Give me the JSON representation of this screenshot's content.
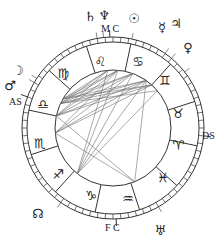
{
  "chart": {
    "center": [
      113,
      128
    ],
    "outer_radius": 91,
    "degree_ring_inner_radius": 86,
    "sign_ring_inner_radius": 58,
    "line_color": "#333333",
    "aspect_line_color": "#6e6e6e"
  },
  "angles": {
    "mc": "M C",
    "fc": "F C",
    "as": "AS",
    "ds": "DS"
  },
  "signs": [
    {
      "name": "leo",
      "glyph": "♌",
      "x": 100,
      "y": 61
    },
    {
      "name": "cancer",
      "glyph": "♋",
      "x": 138,
      "y": 61
    },
    {
      "name": "gemini",
      "glyph": "♊",
      "x": 165,
      "y": 80
    },
    {
      "name": "taurus",
      "glyph": "♉",
      "x": 178,
      "y": 113
    },
    {
      "name": "aries",
      "glyph": "♈",
      "x": 178,
      "y": 145
    },
    {
      "name": "pisces",
      "glyph": "♓",
      "x": 163,
      "y": 177
    },
    {
      "name": "aquarius",
      "glyph": "♒",
      "x": 128,
      "y": 198
    },
    {
      "name": "capricorn",
      "glyph": "♑",
      "x": 91,
      "y": 195
    },
    {
      "name": "sagittarius",
      "glyph": "♐",
      "x": 58,
      "y": 174
    },
    {
      "name": "scorpio",
      "glyph": "♏",
      "x": 40,
      "y": 143
    },
    {
      "name": "libra",
      "glyph": "♎",
      "x": 43,
      "y": 104
    },
    {
      "name": "virgo",
      "glyph": "♍",
      "x": 63,
      "y": 73
    }
  ],
  "planets": [
    {
      "name": "saturn",
      "glyph": "♄",
      "x": 90,
      "y": 16
    },
    {
      "name": "neptune",
      "glyph": "♆",
      "x": 104,
      "y": 15
    },
    {
      "name": "sun",
      "glyph": "☉",
      "x": 134,
      "y": 18
    },
    {
      "name": "mercury",
      "glyph": "☿",
      "x": 162,
      "y": 27
    },
    {
      "name": "jupiter",
      "glyph": "♃",
      "x": 176,
      "y": 23
    },
    {
      "name": "venus",
      "glyph": "♀",
      "x": 188,
      "y": 47
    },
    {
      "name": "moon",
      "glyph": "☽",
      "x": 18,
      "y": 70
    },
    {
      "name": "mars",
      "glyph": "♂",
      "x": 10,
      "y": 85
    },
    {
      "name": "node",
      "glyph": "☊",
      "x": 38,
      "y": 213
    },
    {
      "name": "uranus",
      "glyph": "♅",
      "x": 160,
      "y": 230
    }
  ],
  "angle_labels": [
    {
      "key": "mc",
      "text": "M C",
      "x": 101,
      "y": 24
    },
    {
      "key": "fc",
      "text": "F C",
      "x": 105,
      "y": 223
    },
    {
      "key": "as",
      "text": "AS",
      "x": 9,
      "y": 97
    },
    {
      "key": "ds",
      "text": "DS",
      "x": 202,
      "y": 131
    }
  ]
}
